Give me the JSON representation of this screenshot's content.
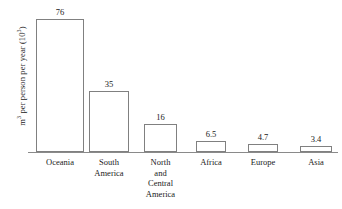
{
  "chart_data": {
    "type": "bar",
    "title": "",
    "xlabel": "",
    "ylabel": "m3 per person per year (103)",
    "ylabel_parts": {
      "unit": "m",
      "unit_exponent": "3",
      "middle": " per person per year (10",
      "scale_exponent": "3",
      "close": ")"
    },
    "categories": [
      "Oceania",
      "South America",
      "North and Central America",
      "Africa",
      "Europe",
      "Asia"
    ],
    "values": [
      76,
      35,
      16,
      6.5,
      4.7,
      3.4
    ],
    "value_labels": [
      "76",
      "35",
      "16",
      "6.5",
      "4.7",
      "3.4"
    ],
    "ylim": [
      0,
      87
    ],
    "grid": false,
    "legend": false,
    "axis_line": "baseline-only",
    "tick_labels": [],
    "bar_fill": "#ffffff",
    "bar_outline": "#808080",
    "baseline_color": "#8a8a8a",
    "text_color": "#1a1a1a"
  },
  "category_lines": [
    [
      "Oceania"
    ],
    [
      "South",
      "America"
    ],
    [
      "North",
      "and",
      "Central",
      "America"
    ],
    [
      "Africa"
    ],
    [
      "Europe"
    ],
    [
      "Asia"
    ]
  ]
}
